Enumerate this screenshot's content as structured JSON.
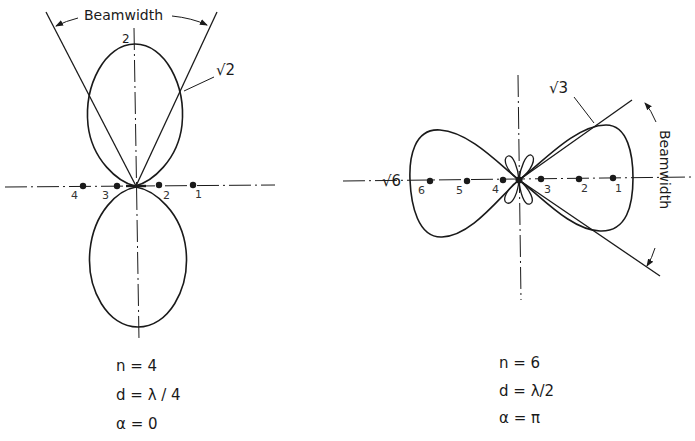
{
  "figure": {
    "left_pattern": {
      "title_label": "Beamwidth",
      "peak_label": "2",
      "half_power_label": "√2",
      "element_labels": [
        "4",
        "3",
        "2",
        "1"
      ],
      "params": {
        "n": "n = 4",
        "d": "d = λ / 4",
        "alpha": "α = 0"
      }
    },
    "right_pattern": {
      "title_label": "Beamwidth",
      "peak_label": "√6",
      "half_power_label": "√3",
      "element_labels": [
        "6",
        "5",
        "4",
        "3",
        "2",
        "1"
      ],
      "params": {
        "n": "n = 6",
        "d": "d = λ/2",
        "alpha": "α = π"
      }
    },
    "colors": {
      "ink": "#1a1a1a",
      "background": "#ffffff"
    }
  }
}
